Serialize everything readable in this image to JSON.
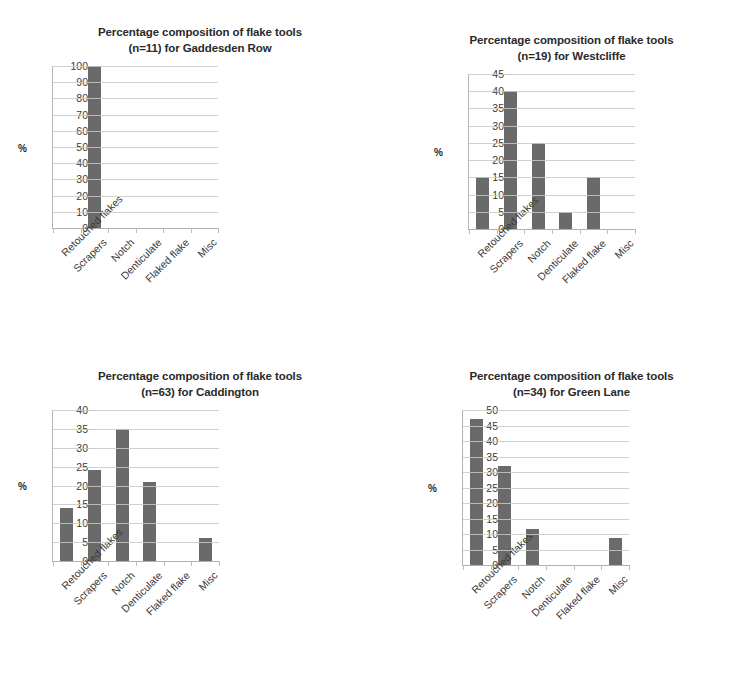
{
  "figure": {
    "title_line1": "Percentage composition of flake tools",
    "y_axis_title": "%",
    "bar_color": "#5f5f5f",
    "gridline_color": "#c9c9c9",
    "axis_color": "#b4b4b4"
  },
  "categories": [
    "Retouched flakes",
    "Scrapers",
    "Notch",
    "Denticulate",
    "Flaked flake",
    "Misc"
  ],
  "chart_data": [
    {
      "type": "bar",
      "id": "gaddesden-row",
      "title": "Percentage composition of flake tools (n=11) for Gaddesden Row",
      "title_line1": "Percentage composition of flake tools",
      "title_line2": "(n=11) for Gaddesden Row",
      "site": "Gaddesden Row",
      "n": 11,
      "xlabel": "",
      "ylabel": "%",
      "categories": [
        "Retouched flakes",
        "Scrapers",
        "Notch",
        "Denticulate",
        "Flaked flake",
        "Misc"
      ],
      "values": [
        0,
        100,
        0,
        0,
        0,
        0
      ],
      "ylim": [
        0,
        100
      ],
      "ytick_step": 10,
      "yticks": [
        0,
        10,
        20,
        30,
        40,
        50,
        60,
        70,
        80,
        90,
        100
      ],
      "grid": true,
      "legend": "none"
    },
    {
      "type": "bar",
      "id": "westcliffe",
      "title": "Percentage composition of flake tools (n=19) for Westcliffe",
      "title_line1": "Percentage composition of flake tools",
      "title_line2": "(n=19) for Westcliffe",
      "site": "Westcliffe",
      "n": 19,
      "xlabel": "",
      "ylabel": "%",
      "categories": [
        "Retouched flakes",
        "Scrapers",
        "Notch",
        "Denticulate",
        "Flaked flake",
        "Misc"
      ],
      "values": [
        15,
        40,
        25,
        5,
        15,
        0
      ],
      "ylim": [
        0,
        45
      ],
      "ytick_step": 5,
      "yticks": [
        0,
        5,
        10,
        15,
        20,
        25,
        30,
        35,
        40,
        45
      ],
      "grid": true,
      "legend": "none"
    },
    {
      "type": "bar",
      "id": "caddington",
      "title": "Percentage composition of flake tools (n=63) for Caddington",
      "title_line1": "Percentage composition of flake tools",
      "title_line2": "(n=63) for Caddington",
      "site": "Caddington",
      "n": 63,
      "xlabel": "",
      "ylabel": "%",
      "categories": [
        "Retouched flakes",
        "Scrapers",
        "Notch",
        "Denticulate",
        "Flaked flake",
        "Misc"
      ],
      "values": [
        14,
        24,
        35,
        21,
        0,
        6
      ],
      "ylim": [
        0,
        40
      ],
      "ytick_step": 5,
      "yticks": [
        0,
        5,
        10,
        15,
        20,
        25,
        30,
        35,
        40
      ],
      "grid": true,
      "legend": "none"
    },
    {
      "type": "bar",
      "id": "green-lane",
      "title": "Percentage composition of flake tools (n=34) for Green Lane",
      "title_line1": "Percentage composition of flake tools",
      "title_line2": "(n=34) for Green Lane",
      "site": "Green Lane",
      "n": 34,
      "xlabel": "",
      "ylabel": "%",
      "categories": [
        "Retouched flakes",
        "Scrapers",
        "Notch",
        "Denticulate",
        "Flaked flake",
        "Misc"
      ],
      "values": [
        47,
        32,
        11.5,
        0,
        0,
        8.8
      ],
      "ylim": [
        0,
        50
      ],
      "ytick_step": 5,
      "yticks": [
        0,
        5,
        10,
        15,
        20,
        25,
        30,
        35,
        40,
        45,
        50
      ],
      "grid": true,
      "legend": "none"
    }
  ]
}
